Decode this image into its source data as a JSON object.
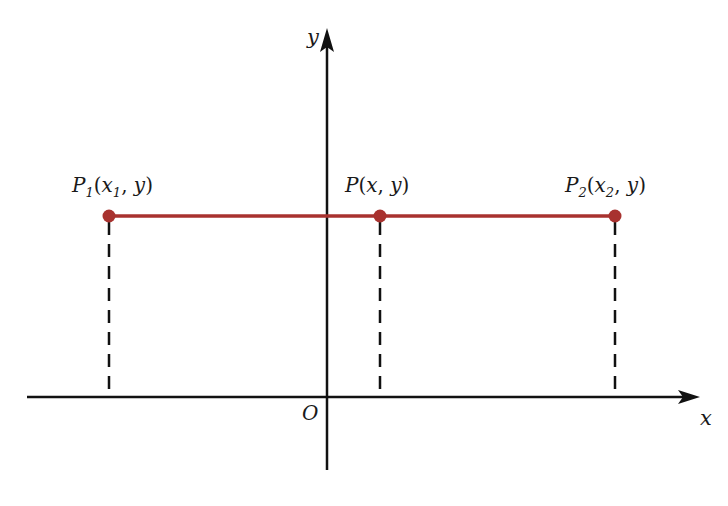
{
  "diagram": {
    "type": "coordinate-plane",
    "axes": {
      "x_label": "x",
      "y_label": "y",
      "origin_label": "O"
    },
    "segment": {
      "color": "#a8322f",
      "description": "horizontal segment from P1 to P2 at constant y"
    },
    "points": [
      {
        "id": "P1",
        "name": "P",
        "sub": "1",
        "coords_open": "(",
        "x": "x",
        "x_sub": "1",
        "sep": ", ",
        "y": "y",
        "coords_close": ")"
      },
      {
        "id": "P",
        "name": "P",
        "sub": "",
        "coords_open": "(",
        "x": "x",
        "x_sub": "",
        "sep": ", ",
        "y": "y",
        "coords_close": ")"
      },
      {
        "id": "P2",
        "name": "P",
        "sub": "2",
        "coords_open": "(",
        "x": "x",
        "x_sub": "2",
        "sep": ", ",
        "y": "y",
        "coords_close": ")"
      }
    ],
    "colors": {
      "axis": "#111111",
      "segment": "#a8322f",
      "point": "#a8322f",
      "dashed": "#111111"
    }
  }
}
